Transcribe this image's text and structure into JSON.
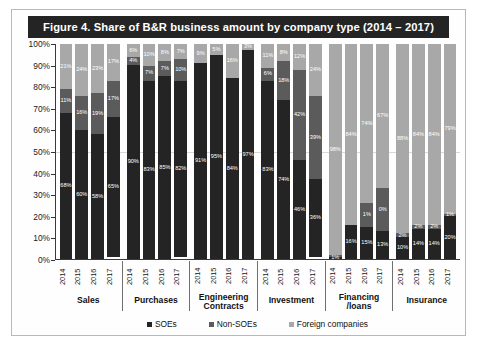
{
  "figure": {
    "title": "Figure 4.  Share of B&R business amount by company type (2014 – 2017)"
  },
  "legend": {
    "items": [
      {
        "label": "SOEs",
        "color": "#242424"
      },
      {
        "label": "Non-SOEs",
        "color": "#5b5b5b"
      },
      {
        "label": "Foreign companies",
        "color": "#a8a8a8"
      }
    ]
  },
  "chart_data": {
    "type": "bar",
    "subtype": "stacked-100-percent",
    "title": "Figure 4.  Share of B&R business amount by company type (2014 – 2017)",
    "xlabel": "",
    "ylabel": "",
    "ylim": [
      0,
      100
    ],
    "grid": false,
    "legend_position": "bottom",
    "yticks": [
      "0%",
      "10%",
      "20%",
      "30%",
      "40%",
      "50%",
      "60%",
      "70%",
      "80%",
      "90%",
      "100%"
    ],
    "years": [
      "2014",
      "2015",
      "2016",
      "2017"
    ],
    "series_order": [
      "SOEs",
      "Non-SOEs",
      "Foreign companies"
    ],
    "groups": [
      {
        "name": "Sales",
        "bars": [
          {
            "year": "2014",
            "soe": 68,
            "nonsoe": 11,
            "foreign": 21,
            "soe_label": "68%",
            "nonsoe_label": "11%",
            "foreign_label": "21%"
          },
          {
            "year": "2015",
            "soe": 60,
            "nonsoe": 16,
            "foreign": 24,
            "soe_label": "60%",
            "nonsoe_label": "16%",
            "foreign_label": "24%"
          },
          {
            "year": "2016",
            "soe": 58,
            "nonsoe": 19,
            "foreign": 23,
            "soe_label": "58%",
            "nonsoe_label": "19%",
            "foreign_label": "23%"
          },
          {
            "year": "2017",
            "soe": 65,
            "nonsoe": 17,
            "foreign": 17,
            "soe_label": "65%",
            "nonsoe_label": "17%",
            "foreign_label": "17%"
          }
        ]
      },
      {
        "name": "Purchases",
        "bars": [
          {
            "year": "2014",
            "soe": 90,
            "nonsoe": 4,
            "foreign": 6,
            "soe_label": "90%",
            "nonsoe_label": "4%",
            "foreign_label": "6%"
          },
          {
            "year": "2015",
            "soe": 83,
            "nonsoe": 7,
            "foreign": 10,
            "soe_label": "83%",
            "nonsoe_label": "7%",
            "foreign_label": "10%"
          },
          {
            "year": "2016",
            "soe": 85,
            "nonsoe": 7,
            "foreign": 8,
            "soe_label": "85%",
            "nonsoe_label": "7%",
            "foreign_label": "8%"
          },
          {
            "year": "2017",
            "soe": 82,
            "nonsoe": 10,
            "foreign": 7,
            "soe_label": "82%",
            "nonsoe_label": "10%",
            "foreign_label": "7%"
          }
        ]
      },
      {
        "name": "Engineering\nContracts",
        "bars": [
          {
            "year": "2014",
            "soe": 91,
            "nonsoe": 0,
            "foreign": 9,
            "soe_label": "91%",
            "nonsoe_label": "",
            "foreign_label": "9%"
          },
          {
            "year": "2015",
            "soe": 95,
            "nonsoe": 0,
            "foreign": 5,
            "soe_label": "95%",
            "nonsoe_label": "",
            "foreign_label": "5%"
          },
          {
            "year": "2016",
            "soe": 84,
            "nonsoe": 0,
            "foreign": 16,
            "soe_label": "84%",
            "nonsoe_label": "",
            "foreign_label": "16%"
          },
          {
            "year": "2017",
            "soe": 97,
            "nonsoe": 0,
            "foreign": 3,
            "soe_label": "97%",
            "nonsoe_label": "",
            "foreign_label": "3%"
          }
        ]
      },
      {
        "name": "Investment",
        "bars": [
          {
            "year": "2014",
            "soe": 83,
            "nonsoe": 6,
            "foreign": 11,
            "soe_label": "83%",
            "nonsoe_label": "6%",
            "foreign_label": "11%"
          },
          {
            "year": "2015",
            "soe": 74,
            "nonsoe": 18,
            "foreign": 8,
            "soe_label": "74%",
            "nonsoe_label": "18%",
            "foreign_label": "8%"
          },
          {
            "year": "2016",
            "soe": 46,
            "nonsoe": 42,
            "foreign": 12,
            "soe_label": "46%",
            "nonsoe_label": "42%",
            "foreign_label": "12%"
          },
          {
            "year": "2017",
            "soe": 36,
            "nonsoe": 39,
            "foreign": 24,
            "soe_label": "36%",
            "nonsoe_label": "39%",
            "foreign_label": "24%"
          }
        ]
      },
      {
        "name": "Financing\n/loans",
        "bars": [
          {
            "year": "2014",
            "soe": 1,
            "nonsoe": 1,
            "foreign": 98,
            "soe_label": "1%",
            "nonsoe_label": "",
            "foreign_label": "98%"
          },
          {
            "year": "2015",
            "soe": 16,
            "nonsoe": 0,
            "foreign": 84,
            "soe_label": "16%",
            "nonsoe_label": "",
            "foreign_label": "84%"
          },
          {
            "year": "2016",
            "soe": 15,
            "nonsoe": 11,
            "foreign": 74,
            "soe_label": "15%",
            "nonsoe_label": "1%",
            "foreign_label": "74%"
          },
          {
            "year": "2017",
            "soe": 13,
            "nonsoe": 20,
            "foreign": 67,
            "soe_label": "13%",
            "nonsoe_label": "0%",
            "foreign_label": "67%"
          }
        ]
      },
      {
        "name": "Insurance",
        "bars": [
          {
            "year": "2014",
            "soe": 10,
            "nonsoe": 2,
            "foreign": 88,
            "soe_label": "10%",
            "nonsoe_label": "2%",
            "foreign_label": "88%"
          },
          {
            "year": "2015",
            "soe": 14,
            "nonsoe": 2,
            "foreign": 84,
            "soe_label": "14%",
            "nonsoe_label": "2%",
            "foreign_label": "84%"
          },
          {
            "year": "2016",
            "soe": 14,
            "nonsoe": 2,
            "foreign": 84,
            "soe_label": "14%",
            "nonsoe_label": "2%",
            "foreign_label": "84%"
          },
          {
            "year": "2017",
            "soe": 20,
            "nonsoe": 1,
            "foreign": 79,
            "soe_label": "20%",
            "nonsoe_label": "1%",
            "foreign_label": "79%"
          }
        ]
      }
    ]
  }
}
